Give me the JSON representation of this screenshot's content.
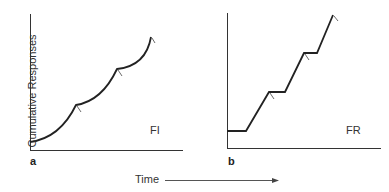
{
  "figure": {
    "y_axis_label": "Cumulative Responses",
    "x_axis_label": "Time",
    "panels": [
      {
        "letter": "a",
        "schedule_label": "FI"
      },
      {
        "letter": "b",
        "schedule_label": "FR"
      }
    ]
  },
  "colors": {
    "line": "#222222",
    "axis": "#333333",
    "arrow": "#555555"
  }
}
